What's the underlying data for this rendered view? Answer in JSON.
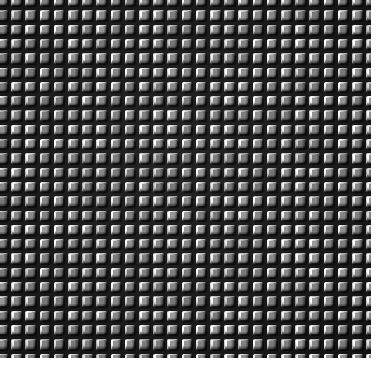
{
  "image": {
    "title": "Microscopic grid texture",
    "description": "Grayscale micrograph of a regular array of raised square cells separated by dark channels",
    "width": 383,
    "height": 367,
    "colorspace": "grayscale"
  },
  "texture": {
    "pattern_type": "square-grid-array",
    "columns": 26,
    "rows": 25,
    "pitch_x": 14.2,
    "pitch_y": 14.3,
    "cell_width": 10.6,
    "cell_height": 10.4,
    "channel_width": 3.6,
    "corner_radius": 2.2,
    "lighting_direction": "upper-left",
    "relief": "raised-square-tiles"
  },
  "palette": {
    "background_paper": "#ffffff",
    "channel_dark": "#1b1b1b",
    "channel_darkest": "#121212",
    "cell_face_mid": "#868686",
    "cell_face_light": "#cfcfcf",
    "cell_highlight": "#f0f0f0",
    "cell_shadow": "#262626",
    "cell_edge_dark": "#4a4a4a"
  },
  "margins": {
    "right_px": 12,
    "bottom_px": 9,
    "left_px": 0,
    "top_px": 0
  }
}
